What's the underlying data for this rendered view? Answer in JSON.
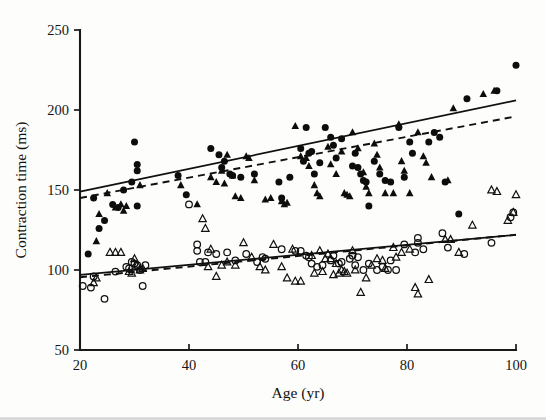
{
  "chart_data": {
    "type": "scatter",
    "title": "",
    "xlabel": "Age (yr)",
    "ylabel": "Contraction time (ms)",
    "xlim": [
      20,
      100
    ],
    "ylim": [
      50,
      250
    ],
    "xticks": [
      20,
      40,
      60,
      80,
      100
    ],
    "yticks": [
      50,
      100,
      150,
      200,
      250
    ],
    "xtick_labels": [
      "20",
      "40",
      "60",
      "80",
      "100"
    ],
    "ytick_labels": [
      "50",
      "100",
      "150",
      "200",
      "250"
    ],
    "grid": false,
    "legend": "none",
    "series": [
      {
        "name": "filled-circle",
        "marker": "filled-circle",
        "color": "#0d0d0d",
        "points": [
          [
            21.5,
            110
          ],
          [
            22.5,
            145
          ],
          [
            23.5,
            126
          ],
          [
            24.5,
            131
          ],
          [
            26.0,
            141
          ],
          [
            27.0,
            139
          ],
          [
            28.0,
            150
          ],
          [
            29.5,
            155
          ],
          [
            30.5,
            140
          ],
          [
            30.0,
            180
          ],
          [
            30.5,
            166
          ],
          [
            30.5,
            162
          ],
          [
            38.0,
            159
          ],
          [
            39.5,
            147
          ],
          [
            44.0,
            176
          ],
          [
            45.5,
            172
          ],
          [
            46.0,
            164
          ],
          [
            46.5,
            168
          ],
          [
            47.5,
            160
          ],
          [
            48.0,
            159
          ],
          [
            49.5,
            158
          ],
          [
            52.0,
            160
          ],
          [
            56.5,
            155
          ],
          [
            57.0,
            145
          ],
          [
            58.5,
            158
          ],
          [
            60.5,
            176
          ],
          [
            61.0,
            168
          ],
          [
            61.5,
            189
          ],
          [
            62.0,
            173
          ],
          [
            62.5,
            174
          ],
          [
            63.0,
            160
          ],
          [
            64.0,
            167
          ],
          [
            65.0,
            189
          ],
          [
            66.0,
            183
          ],
          [
            66.5,
            178
          ],
          [
            67.0,
            170
          ],
          [
            68.0,
            182
          ],
          [
            70.0,
            165
          ],
          [
            70.5,
            173
          ],
          [
            71.0,
            164
          ],
          [
            71.5,
            160
          ],
          [
            72.0,
            156
          ],
          [
            72.5,
            155
          ],
          [
            73.0,
            140
          ],
          [
            74.0,
            168
          ],
          [
            75.0,
            160
          ],
          [
            76.0,
            156
          ],
          [
            77.0,
            155
          ],
          [
            78.5,
            189
          ],
          [
            79.5,
            158
          ],
          [
            80.5,
            180
          ],
          [
            81.0,
            173
          ],
          [
            84.0,
            180
          ],
          [
            85.0,
            186
          ],
          [
            86.0,
            183
          ],
          [
            87.0,
            155
          ],
          [
            89.5,
            135
          ],
          [
            91.0,
            207
          ],
          [
            96.5,
            212
          ],
          [
            100.0,
            228
          ]
        ]
      },
      {
        "name": "filled-triangle",
        "marker": "filled-triangle",
        "color": "#0d0d0d",
        "points": [
          [
            23.0,
            118
          ],
          [
            23.5,
            135
          ],
          [
            25.0,
            148
          ],
          [
            26.5,
            139
          ],
          [
            27.5,
            141
          ],
          [
            28.0,
            137
          ],
          [
            28.5,
            140
          ],
          [
            31.0,
            153
          ],
          [
            38.5,
            153
          ],
          [
            41.5,
            141
          ],
          [
            44.0,
            158
          ],
          [
            45.0,
            155
          ],
          [
            46.0,
            162
          ],
          [
            46.5,
            154
          ],
          [
            47.0,
            172
          ],
          [
            48.0,
            159
          ],
          [
            48.5,
            146
          ],
          [
            49.5,
            145
          ],
          [
            50.5,
            171
          ],
          [
            51.0,
            170
          ],
          [
            52.0,
            156
          ],
          [
            54.0,
            144
          ],
          [
            55.0,
            145
          ],
          [
            57.0,
            143
          ],
          [
            57.5,
            141
          ],
          [
            58.0,
            142
          ],
          [
            59.5,
            190
          ],
          [
            60.5,
            171
          ],
          [
            61.5,
            170
          ],
          [
            62.0,
            165
          ],
          [
            63.0,
            153
          ],
          [
            63.5,
            148
          ],
          [
            64.0,
            146
          ],
          [
            65.5,
            177
          ],
          [
            66.0,
            166
          ],
          [
            67.0,
            160
          ],
          [
            68.0,
            174
          ],
          [
            68.5,
            148
          ],
          [
            69.0,
            147
          ],
          [
            69.5,
            146
          ],
          [
            70.0,
            186
          ],
          [
            71.0,
            176
          ],
          [
            72.0,
            161
          ],
          [
            72.5,
            152
          ],
          [
            73.0,
            148
          ],
          [
            74.0,
            179
          ],
          [
            74.5,
            172
          ],
          [
            75.0,
            164
          ],
          [
            76.0,
            148
          ],
          [
            77.5,
            148
          ],
          [
            78.5,
            191
          ],
          [
            79.0,
            168
          ],
          [
            79.5,
            162
          ],
          [
            80.5,
            148
          ],
          [
            82.0,
            186
          ],
          [
            83.0,
            171
          ],
          [
            83.5,
            167
          ],
          [
            84.5,
            158
          ],
          [
            87.5,
            156
          ],
          [
            88.5,
            201
          ],
          [
            94.0,
            210
          ],
          [
            96.0,
            212
          ]
        ]
      },
      {
        "name": "open-circle",
        "marker": "open-circle",
        "color": "#101010",
        "points": [
          [
            20.5,
            90
          ],
          [
            22.0,
            89
          ],
          [
            22.5,
            96
          ],
          [
            24.5,
            82
          ],
          [
            26.5,
            99
          ],
          [
            28.5,
            102
          ],
          [
            29.0,
            101
          ],
          [
            29.5,
            105
          ],
          [
            30.0,
            104
          ],
          [
            30.5,
            103
          ],
          [
            31.0,
            100
          ],
          [
            31.5,
            90
          ],
          [
            32.0,
            103
          ],
          [
            40.0,
            141
          ],
          [
            41.5,
            112
          ],
          [
            41.5,
            116
          ],
          [
            42.0,
            105
          ],
          [
            43.0,
            105
          ],
          [
            43.5,
            111
          ],
          [
            45.0,
            110
          ],
          [
            47.0,
            111
          ],
          [
            48.5,
            106
          ],
          [
            50.5,
            110
          ],
          [
            52.5,
            105
          ],
          [
            53.5,
            108
          ],
          [
            54.0,
            107
          ],
          [
            57.0,
            113
          ],
          [
            59.5,
            112
          ],
          [
            60.5,
            112
          ],
          [
            61.5,
            109
          ],
          [
            62.0,
            108
          ],
          [
            62.5,
            104
          ],
          [
            63.5,
            102
          ],
          [
            64.5,
            103
          ],
          [
            66.0,
            106
          ],
          [
            66.5,
            109
          ],
          [
            67.5,
            104
          ],
          [
            68.0,
            105
          ],
          [
            69.5,
            107
          ],
          [
            70.0,
            109
          ],
          [
            70.5,
            103
          ],
          [
            71.0,
            108
          ],
          [
            72.0,
            100
          ],
          [
            73.0,
            104
          ],
          [
            74.5,
            100
          ],
          [
            75.5,
            102
          ],
          [
            76.5,
            100
          ],
          [
            77.0,
            106
          ],
          [
            78.0,
            100
          ],
          [
            79.5,
            116
          ],
          [
            81.5,
            111
          ],
          [
            82.0,
            120
          ],
          [
            82.0,
            117
          ],
          [
            83.0,
            113
          ],
          [
            86.5,
            123
          ],
          [
            87.5,
            114
          ],
          [
            90.5,
            110
          ],
          [
            95.5,
            117
          ],
          [
            99.0,
            133
          ],
          [
            99.5,
            136
          ]
        ]
      },
      {
        "name": "open-triangle",
        "marker": "open-triangle",
        "color": "#101010",
        "points": [
          [
            22.5,
            92
          ],
          [
            23.0,
            95
          ],
          [
            25.5,
            111
          ],
          [
            26.5,
            111
          ],
          [
            27.5,
            111
          ],
          [
            29.0,
            99
          ],
          [
            29.5,
            98
          ],
          [
            30.0,
            107
          ],
          [
            30.5,
            103
          ],
          [
            31.0,
            100
          ],
          [
            31.5,
            101
          ],
          [
            42.5,
            132
          ],
          [
            43.0,
            126
          ],
          [
            43.5,
            102
          ],
          [
            44.0,
            113
          ],
          [
            45.0,
            96
          ],
          [
            46.0,
            103
          ],
          [
            47.0,
            105
          ],
          [
            48.5,
            103
          ],
          [
            50.0,
            117
          ],
          [
            51.5,
            108
          ],
          [
            53.0,
            102
          ],
          [
            54.0,
            100
          ],
          [
            55.5,
            116
          ],
          [
            57.0,
            102
          ],
          [
            58.0,
            95
          ],
          [
            59.0,
            113
          ],
          [
            59.5,
            93
          ],
          [
            60.5,
            93
          ],
          [
            62.5,
            109
          ],
          [
            63.0,
            98
          ],
          [
            64.0,
            112
          ],
          [
            64.5,
            99
          ],
          [
            65.0,
            107
          ],
          [
            65.5,
            110
          ],
          [
            66.0,
            107
          ],
          [
            66.5,
            97
          ],
          [
            67.0,
            104
          ],
          [
            67.5,
            98
          ],
          [
            68.0,
            100
          ],
          [
            68.5,
            99
          ],
          [
            69.0,
            98
          ],
          [
            70.0,
            112
          ],
          [
            70.5,
            100
          ],
          [
            71.5,
            86
          ],
          [
            72.5,
            95
          ],
          [
            73.5,
            103
          ],
          [
            74.5,
            107
          ],
          [
            75.5,
            106
          ],
          [
            76.0,
            101
          ],
          [
            77.5,
            114
          ],
          [
            78.0,
            108
          ],
          [
            79.0,
            111
          ],
          [
            80.5,
            113
          ],
          [
            81.5,
            89
          ],
          [
            82.0,
            85
          ],
          [
            84.0,
            94
          ],
          [
            87.0,
            119
          ],
          [
            88.0,
            119
          ],
          [
            89.5,
            111
          ],
          [
            92.0,
            128
          ],
          [
            95.5,
            150
          ],
          [
            96.5,
            149
          ],
          [
            98.5,
            131
          ],
          [
            99.5,
            136
          ],
          [
            100.0,
            147
          ]
        ]
      }
    ],
    "fit_lines": [
      {
        "name": "upper-solid-fit",
        "style": "solid",
        "x": [
          20,
          100
        ],
        "y": [
          149,
          206
        ]
      },
      {
        "name": "upper-dashed-fit",
        "style": "dashed",
        "x": [
          20,
          100
        ],
        "y": [
          145,
          196
        ]
      },
      {
        "name": "lower-solid-fit",
        "style": "solid",
        "x": [
          20,
          100
        ],
        "y": [
          97,
          122
        ]
      },
      {
        "name": "lower-dashed-fit",
        "style": "dashed",
        "x": [
          20,
          100
        ],
        "y": [
          95.5,
          122
        ]
      }
    ]
  }
}
